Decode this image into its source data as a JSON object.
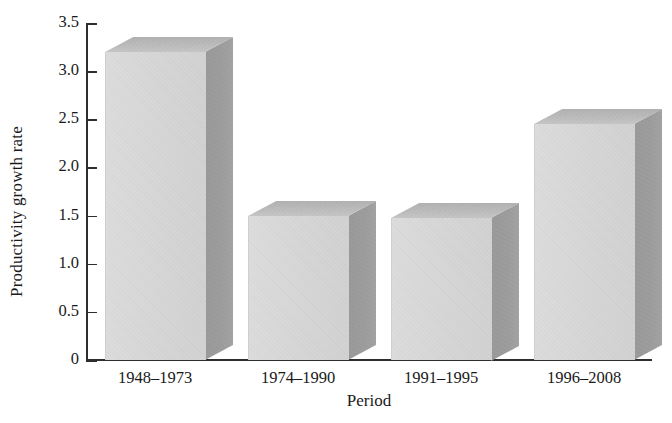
{
  "chart_data": {
    "type": "bar",
    "title": "",
    "subtitle": "",
    "xlabel": "Period",
    "ylabel": "Productivity growth rate",
    "categories": [
      "1948–1973",
      "1974–1990",
      "1991–1995",
      "1996–2008"
    ],
    "values": [
      3.2,
      1.5,
      1.48,
      2.45
    ],
    "series": [
      {
        "name": "Productivity growth rate",
        "values": [
          3.2,
          1.5,
          1.48,
          2.45
        ]
      }
    ],
    "ylim": [
      0,
      3.5
    ],
    "ytick_labels": [
      "0",
      "0.5",
      "1.0",
      "1.5",
      "2.0",
      "2.5",
      "3.0",
      "3.5"
    ],
    "ytick_values": [
      0,
      0.5,
      1.0,
      1.5,
      2.0,
      2.5,
      3.0,
      3.5
    ],
    "grid": false,
    "legend": false,
    "legend_position": "none",
    "style": "3d-bar",
    "colors": {
      "bar_front": "#d6d6d6",
      "bar_top": "#bdbdbd",
      "bar_side": "#9d9d9d",
      "axis": "#2e2e2e",
      "text": "#1a1a1a",
      "background": "#ffffff"
    }
  }
}
